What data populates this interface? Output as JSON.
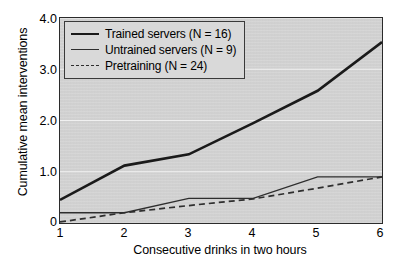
{
  "chart_data": {
    "type": "line",
    "title": "",
    "xlabel": "Consecutive drinks in two hours",
    "ylabel": "Cumulative mean interventions",
    "x": [
      1,
      2,
      3,
      4,
      5,
      6
    ],
    "xlim": [
      1,
      6
    ],
    "ylim": [
      0,
      4.0
    ],
    "xticks": [
      "1",
      "2",
      "3",
      "4",
      "5",
      "6"
    ],
    "yticks": [
      "0",
      "1.0",
      "2.0",
      "3.0",
      "4.0"
    ],
    "ytick_values": [
      0,
      1.0,
      2.0,
      3.0,
      4.0
    ],
    "grid": "horizontal",
    "legend_position": "upper-left",
    "series": [
      {
        "name": "Trained servers (N = 16)",
        "style": "solid-thick",
        "color": "#1a1a1a",
        "values": [
          0.45,
          1.12,
          1.34,
          1.95,
          2.58,
          3.53
        ]
      },
      {
        "name": "Untrained servers (N = 9)",
        "style": "solid-thin",
        "color": "#2e2e2e",
        "values": [
          0.2,
          0.2,
          0.48,
          0.48,
          0.9,
          0.9
        ]
      },
      {
        "name": "Pretraining (N = 24)",
        "style": "dashed",
        "color": "#2e2e2e",
        "values": [
          0.02,
          0.2,
          0.34,
          0.47,
          0.68,
          0.9
        ]
      }
    ]
  },
  "legend": {
    "items": [
      {
        "label": "Trained servers (N = 16)"
      },
      {
        "label": "Untrained servers (N = 9)"
      },
      {
        "label": "Pretraining (N = 24)"
      }
    ]
  },
  "axes": {
    "x_title": "Consecutive drinks in two hours",
    "y_title": "Cumulative mean interventions",
    "x_ticks": [
      "1",
      "2",
      "3",
      "4",
      "5",
      "6"
    ],
    "y_ticks": [
      "4.0",
      "3.0",
      "2.0",
      "1.0",
      "0"
    ]
  },
  "colors": {
    "plot_background": "#d6d6d6",
    "frame": "#2b2b2b",
    "gridline": "#f0f0f0",
    "series_primary": "#1a1a1a",
    "series_secondary": "#2e2e2e",
    "page_background": "#ffffff"
  }
}
